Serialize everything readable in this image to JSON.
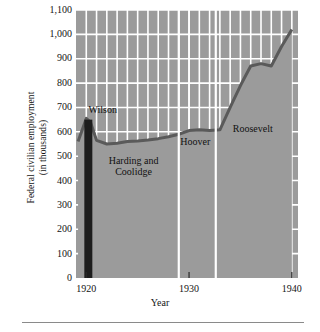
{
  "chart_data": {
    "type": "area",
    "title": "",
    "xlabel": "Year",
    "ylabel": "Federal civilian employment (in thousands)",
    "ylabel_line1": "Federal civilian employment",
    "ylabel_line2": "(in thousands)",
    "xlim": [
      1919,
      1940.6
    ],
    "ylim": [
      0,
      1100
    ],
    "grid": true,
    "grid_color": "#ffffff",
    "area_color": "#9b9b9b",
    "line_color": "#5a5a5a",
    "marker_bar_color": "#1d1d1d",
    "legend_position": "none",
    "yticks": [
      0,
      100,
      200,
      300,
      400,
      500,
      600,
      700,
      800,
      900,
      1000,
      1100
    ],
    "ytick_labels": [
      "0",
      "100",
      "200",
      "300",
      "400",
      "500",
      "600",
      "700",
      "800",
      "900",
      "1,000",
      "1,100"
    ],
    "xticks": [
      1920,
      1930,
      1940
    ],
    "xtick_labels": [
      "1920",
      "1930",
      "1940"
    ],
    "x_minor_gridline_years": [
      1921,
      1922,
      1923,
      1924,
      1925,
      1926,
      1927,
      1928,
      1929,
      1930,
      1931,
      1932,
      1933,
      1934,
      1935,
      1936,
      1937,
      1938,
      1939
    ],
    "x": [
      1919.2,
      1920.0,
      1920.4,
      1921.0,
      1922.0,
      1923.0,
      1924.0,
      1925.0,
      1926.0,
      1927.0,
      1928.0,
      1929.0,
      1930.0,
      1931.0,
      1932.0,
      1933.0,
      1934.0,
      1935.0,
      1936.0,
      1937.0,
      1938.0,
      1939.0,
      1940.0
    ],
    "values": [
      560,
      655,
      640,
      565,
      550,
      553,
      560,
      562,
      566,
      572,
      580,
      590,
      605,
      608,
      605,
      608,
      700,
      790,
      870,
      880,
      870,
      950,
      1020
    ],
    "annotations": [
      {
        "label": "Wilson",
        "x": 1921.6,
        "y": 690
      },
      {
        "label": "Harding and Coolidge",
        "x": 1924.6,
        "y": 460
      },
      {
        "label": "Hoover",
        "x": 1930.6,
        "y": 560
      },
      {
        "label": "Roosevelt",
        "x": 1936.2,
        "y": 610
      }
    ],
    "era_dividers": [
      {
        "year": 1929.0,
        "label": "Coolidge to Hoover"
      },
      {
        "year": 1932.6,
        "label": "Hoover to Roosevelt"
      }
    ],
    "highlight_bar": {
      "year": 1920.2,
      "label": "1920 baseline",
      "from": 0,
      "to": 650
    }
  },
  "axis": {
    "x_title": "Year",
    "y_title_line1": "Federal civilian employment",
    "y_title_line2": "(in thousands)"
  },
  "ylabels": {
    "t1100": "1,100",
    "t1000": "1,000",
    "t900": "900",
    "t800": "800",
    "t700": "700",
    "t600": "600",
    "t500": "500",
    "t400": "400",
    "t300": "300",
    "t200": "200",
    "t100": "100",
    "t0": "0"
  },
  "xlabels": {
    "x1920": "1920",
    "x1930": "1930",
    "x1940": "1940"
  },
  "eras": {
    "wilson": "Wilson",
    "harding_line1": "Harding and",
    "harding_line2": "Coolidge",
    "hoover": "Hoover",
    "roosevelt": "Roosevelt"
  }
}
